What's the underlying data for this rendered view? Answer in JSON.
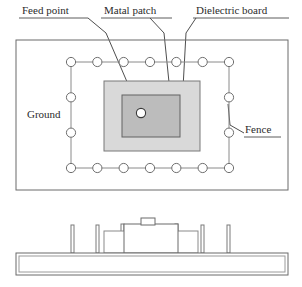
{
  "figure": {
    "width": 302,
    "height": 287,
    "background": "#ffffff"
  },
  "callouts": [
    {
      "id": "feed_point",
      "label": "Feed point",
      "underlined": true,
      "text_x": 22,
      "text_y": 14,
      "ul_x1": 19,
      "ul_x2": 88,
      "ul_y": 18,
      "leader": "M88,18 L106,33 L140,112"
    },
    {
      "id": "metal_patch",
      "label": "Matal patch",
      "underlined": true,
      "text_x": 104,
      "text_y": 14,
      "ul_x1": 101,
      "ul_x2": 172,
      "ul_y": 18,
      "leader": "M150,18 L164,33 L172,112"
    },
    {
      "id": "dielectric_board",
      "label": "Dielectric board",
      "underlined": true,
      "text_x": 196,
      "text_y": 14,
      "ul_x1": 193,
      "ul_x2": 289,
      "ul_y": 18,
      "leader": "M196,18 L186,33 L183,88"
    }
  ],
  "region_labels": [
    {
      "id": "ground",
      "label": "Ground",
      "underlined": false,
      "text_x": 27,
      "text_y": 118,
      "anchor": "start"
    },
    {
      "id": "fence",
      "label": "Fence",
      "underlined": true,
      "text_x": 245,
      "text_y": 133,
      "anchor": "start",
      "ul_x1": 244,
      "ul_x2": 281,
      "ul_y": 137,
      "leader": "M244,133 L230,125 L228,104"
    }
  ],
  "top_view": {
    "ground_rect": {
      "x": 16,
      "y": 40,
      "width": 272,
      "height": 150,
      "fill": "#ffffff",
      "stroke": "#6b6b6b"
    },
    "dielectric_rect": {
      "x": 104,
      "y": 81,
      "width": 96,
      "height": 70,
      "fill": "#d9d9d9",
      "stroke": "#787878"
    },
    "patch_rect": {
      "x": 122,
      "y": 95,
      "width": 58,
      "height": 42,
      "fill": "#bcbcbc",
      "stroke": "#636363"
    },
    "feed_point": {
      "cx": 141,
      "cy": 113,
      "r": 4.6,
      "fill": "#ffffff",
      "stroke": "#3a3a3a"
    },
    "fence": {
      "via_radius": 4.6,
      "ring_left": 71,
      "ring_right": 229,
      "ring_top": 62,
      "ring_bottom": 168,
      "top_row_count": 7,
      "bottom_row_count": 7,
      "left_col_count": 4,
      "right_col_count": 4,
      "via_fill": "#ffffff",
      "via_stroke": "#6f6f6f",
      "link_stroke": "#8a8a8a"
    }
  },
  "side_view": {
    "base_slab": {
      "x": 16,
      "y": 253,
      "width": 272,
      "height": 22,
      "fill": "#ffffff",
      "stroke": "#6b6b6b"
    },
    "inner_slab": {
      "x": 19,
      "y": 256,
      "width": 266,
      "height": 16,
      "fill": "#ffffff",
      "stroke": "#9a9a9a"
    },
    "left_block": {
      "x": 104,
      "y": 231,
      "width": 42,
      "height": 22,
      "fill": "#ffffff",
      "stroke": "#8a8a8a"
    },
    "right_block": {
      "x": 156,
      "y": 231,
      "width": 42,
      "height": 22,
      "fill": "#ffffff",
      "stroke": "#8a8a8a"
    },
    "center_block": {
      "x": 124,
      "y": 224,
      "width": 54,
      "height": 29,
      "fill": "#ffffff",
      "stroke": "#6b6b6b"
    },
    "feed_tab": {
      "x": 141,
      "y": 218,
      "width": 14,
      "height": 7,
      "fill": "#ffffff",
      "stroke": "#6b6b6b"
    },
    "posts": [
      {
        "x": 71,
        "y": 225,
        "width": 3,
        "height": 28
      },
      {
        "x": 96,
        "y": 225,
        "width": 3,
        "height": 28
      },
      {
        "x": 121,
        "y": 224,
        "width": 3,
        "height": 29
      },
      {
        "x": 148,
        "y": 224,
        "width": 3,
        "height": 29
      },
      {
        "x": 175,
        "y": 224,
        "width": 3,
        "height": 29
      },
      {
        "x": 201,
        "y": 225,
        "width": 3,
        "height": 28
      },
      {
        "x": 227,
        "y": 225,
        "width": 3,
        "height": 28
      }
    ],
    "post_fill": "#ffffff",
    "post_stroke": "#7a7a7a"
  },
  "colors": {
    "outline": "#6b6b6b",
    "dielectric_gray": "#d9d9d9",
    "patch_gray": "#bcbcbc",
    "text": "#2b2b2b",
    "leader": "#3a3a3a",
    "fence_link": "#8a8a8a"
  }
}
